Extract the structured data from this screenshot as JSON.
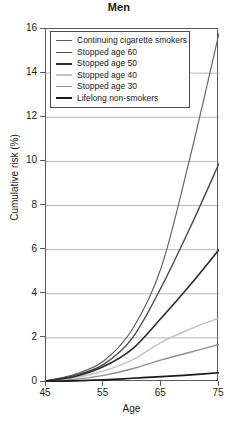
{
  "chart_data": {
    "type": "line",
    "title": "Men",
    "subtitle": "",
    "xlabel": "Age",
    "ylabel": "Cumulative risk (%)",
    "xlim": [
      45,
      75
    ],
    "ylim": [
      0,
      16
    ],
    "xticks": [
      45,
      55,
      65,
      75
    ],
    "yticks": [
      0,
      2,
      4,
      6,
      8,
      10,
      12,
      14,
      16
    ],
    "grid": true,
    "grid_axis": "y",
    "legend_position": "upper left",
    "x": [
      45,
      50,
      55,
      60,
      65,
      70,
      75
    ],
    "series": [
      {
        "name": "Continuing cigarette smokers",
        "color": "#5b5b5b",
        "width": 1.1,
        "values": [
          0.05,
          0.35,
          0.95,
          2.4,
          5.2,
          10.2,
          15.8
        ]
      },
      {
        "name": "Stopped age 60",
        "color": "#4a4a4a",
        "width": 1.4,
        "values": [
          0.05,
          0.3,
          0.8,
          2.0,
          4.3,
          7.0,
          9.9
        ]
      },
      {
        "name": "Stopped age 50",
        "color": "#2b2b2b",
        "width": 1.6,
        "values": [
          0.05,
          0.25,
          0.7,
          1.5,
          2.9,
          4.4,
          6.0
        ]
      },
      {
        "name": "Stopped age 40",
        "color": "#c4c4c4",
        "width": 1.5,
        "values": [
          0.05,
          0.2,
          0.5,
          1.0,
          1.8,
          2.4,
          2.9
        ]
      },
      {
        "name": "Stopped age 30",
        "color": "#8f8f8f",
        "width": 1.4,
        "values": [
          0.04,
          0.12,
          0.3,
          0.6,
          1.0,
          1.35,
          1.7
        ]
      },
      {
        "name": "Lifelong non-smokers",
        "color": "#1a1a1a",
        "width": 1.7,
        "values": [
          0.02,
          0.05,
          0.1,
          0.17,
          0.24,
          0.32,
          0.42
        ]
      }
    ]
  },
  "legend": {
    "entries": [
      "Continuing cigarette smokers",
      "Stopped age 60",
      "Stopped age 50",
      "Stopped age 40",
      "Stopped age 30",
      "Lifelong non-smokers"
    ]
  },
  "axes": {
    "y_tick_labels": [
      "16",
      "14",
      "12",
      "10",
      "8",
      "6",
      "4",
      "2",
      "0"
    ],
    "x_tick_labels": [
      "45",
      "55",
      "65",
      "75"
    ]
  }
}
